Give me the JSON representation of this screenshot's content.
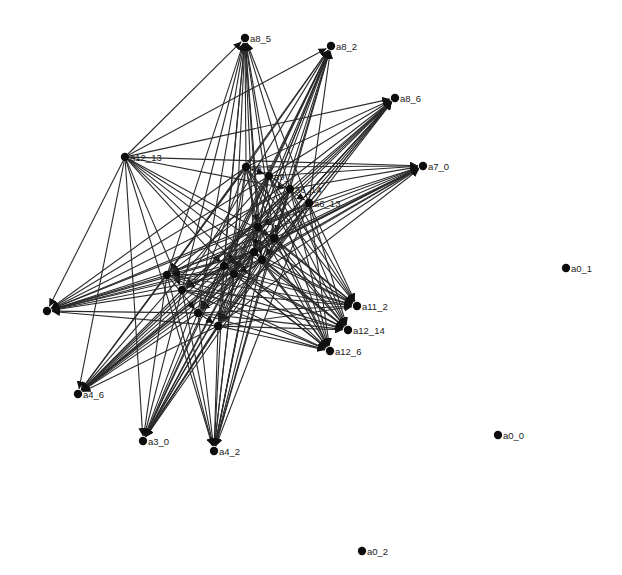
{
  "graph": {
    "type": "directed-network",
    "node_color": "#0d0d0d",
    "edge_color": "#2a2a2a",
    "background": "#ffffff",
    "nodes": [
      {
        "id": "a8_5",
        "label": "a8_5",
        "x": 245,
        "y": 38
      },
      {
        "id": "a8_2",
        "label": "a8_2",
        "x": 331,
        "y": 46
      },
      {
        "id": "a8_6",
        "label": "a8_6",
        "x": 395,
        "y": 98
      },
      {
        "id": "a7_0",
        "label": "a7_0",
        "x": 423,
        "y": 166
      },
      {
        "id": "a12_13",
        "label": "a12_13",
        "x": 125,
        "y": 157
      },
      {
        "id": "c1",
        "label": "a6_6",
        "x": 246,
        "y": 167
      },
      {
        "id": "c2",
        "label": "a9_",
        "x": 269,
        "y": 176
      },
      {
        "id": "c3",
        "label": "a6_14",
        "x": 290,
        "y": 189
      },
      {
        "id": "a6_13",
        "label": "a6_13",
        "x": 309,
        "y": 203
      },
      {
        "id": "c4",
        "label": "",
        "x": 258,
        "y": 227
      },
      {
        "id": "c5",
        "label": "",
        "x": 274,
        "y": 238
      },
      {
        "id": "c6",
        "label": "",
        "x": 254,
        "y": 252
      },
      {
        "id": "c7",
        "label": "",
        "x": 262,
        "y": 260
      },
      {
        "id": "c8",
        "label": "",
        "x": 224,
        "y": 266
      },
      {
        "id": "c9",
        "label": "",
        "x": 234,
        "y": 274
      },
      {
        "id": "c10",
        "label": "",
        "x": 167,
        "y": 275
      },
      {
        "id": "c11",
        "label": "",
        "x": 182,
        "y": 290
      },
      {
        "id": "c12",
        "label": "",
        "x": 198,
        "y": 313
      },
      {
        "id": "c13",
        "label": "",
        "x": 218,
        "y": 326
      },
      {
        "id": "a11_2",
        "label": "a11_2",
        "x": 357,
        "y": 306
      },
      {
        "id": "a12_14",
        "label": "a12_14",
        "x": 348,
        "y": 330
      },
      {
        "id": "a12_6",
        "label": "a12_6",
        "x": 330,
        "y": 351
      },
      {
        "id": "left1",
        "label": "",
        "x": 47,
        "y": 311
      },
      {
        "id": "a4_6",
        "label": "a4_6",
        "x": 78,
        "y": 394
      },
      {
        "id": "a3_0",
        "label": "a3_0",
        "x": 143,
        "y": 441
      },
      {
        "id": "a4_2",
        "label": "a4_2",
        "x": 214,
        "y": 451
      },
      {
        "id": "a0_1",
        "label": "a0_1",
        "x": 566,
        "y": 268
      },
      {
        "id": "a0_0",
        "label": "a0_0",
        "x": 498,
        "y": 435
      },
      {
        "id": "a0_2",
        "label": "a0_2",
        "x": 362,
        "y": 551
      }
    ],
    "hubs": [
      "a12_13",
      "c1",
      "c2",
      "c3",
      "a6_13",
      "c4",
      "c5",
      "c6",
      "c7",
      "c8",
      "c9",
      "c10",
      "c11",
      "c12",
      "c13"
    ],
    "targets": [
      "a8_5",
      "a8_2",
      "a8_6",
      "a7_0",
      "a11_2",
      "a12_14",
      "a12_6",
      "left1",
      "a4_6",
      "a3_0",
      "a4_2"
    ]
  }
}
